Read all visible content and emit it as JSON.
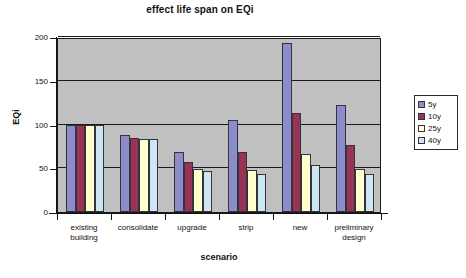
{
  "chart_data": {
    "type": "bar",
    "title": "effect life span on EQi",
    "xlabel": "scenario",
    "ylabel": "EQi",
    "categories": [
      "existing building",
      "consolidate",
      "upgrade",
      "strip",
      "new",
      "preliminary design"
    ],
    "category_lines": [
      [
        "existing",
        "building"
      ],
      [
        "consolidate"
      ],
      [
        "upgrade"
      ],
      [
        "strip"
      ],
      [
        "new"
      ],
      [
        "preliminary",
        "design"
      ]
    ],
    "series": [
      {
        "name": "5y",
        "color": "#8c8cc8",
        "values": [
          100,
          88,
          69,
          105,
          193,
          122
        ]
      },
      {
        "name": "10y",
        "color": "#993354",
        "values": [
          100,
          85,
          57,
          69,
          113,
          77
        ]
      },
      {
        "name": "25y",
        "color": "#ffffcc",
        "values": [
          100,
          84,
          49,
          48,
          66,
          49
        ]
      },
      {
        "name": "40y",
        "color": "#cce6f2",
        "values": [
          100,
          84,
          47,
          43,
          54,
          43
        ]
      }
    ],
    "ylim": [
      0,
      200
    ],
    "yticks": [
      0,
      50,
      100,
      150,
      200
    ],
    "grid": true,
    "legend_position": "right",
    "plot_background": "#c0c0c0",
    "page_background": "#ffffff"
  }
}
